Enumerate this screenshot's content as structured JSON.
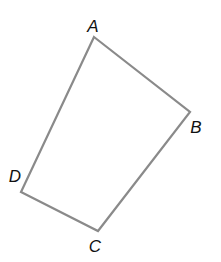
{
  "figure": {
    "type": "quadrilateral",
    "stroke_color": "#8a8a8a",
    "label_color": "#111111",
    "vertices": [
      {
        "name": "A",
        "x": 94,
        "y": 37,
        "label": "A",
        "label_x": 93,
        "label_y": 26
      },
      {
        "name": "B",
        "x": 190,
        "y": 112,
        "label": "B",
        "label_x": 196,
        "label_y": 127
      },
      {
        "name": "C",
        "x": 98,
        "y": 231,
        "label": "C",
        "label_x": 95,
        "label_y": 246
      },
      {
        "name": "D",
        "x": 21,
        "y": 192,
        "label": "D",
        "label_x": 15,
        "label_y": 176
      }
    ],
    "edges": [
      {
        "from": "A",
        "to": "B"
      },
      {
        "from": "B",
        "to": "C"
      },
      {
        "from": "C",
        "to": "D"
      },
      {
        "from": "D",
        "to": "A"
      }
    ]
  }
}
